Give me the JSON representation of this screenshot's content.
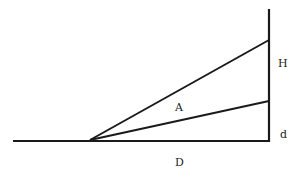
{
  "diagram": {
    "title": "",
    "labels": {
      "H": "H",
      "A": "A",
      "d": "d",
      "D": "D"
    },
    "lines": [
      {
        "name": "ground-line",
        "x1": 13,
        "y1": 141,
        "x2": 270,
        "y2": 141
      },
      {
        "name": "vertical-line",
        "x1": 269,
        "y1": 9,
        "x2": 269,
        "y2": 141
      },
      {
        "name": "upper-sight-line",
        "x1": 90,
        "y1": 140,
        "x2": 269,
        "y2": 40
      },
      {
        "name": "lower-sight-line",
        "x1": 90,
        "y1": 140,
        "x2": 269,
        "y2": 101
      }
    ],
    "stroke_color": "#1a1a1a"
  }
}
